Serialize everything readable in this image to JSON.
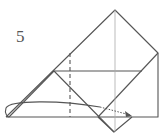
{
  "diagram": {
    "type": "origami-folding-step",
    "step_number": "5",
    "colors": {
      "line": "#555555",
      "thin_line": "#aaaaaa",
      "background": "#ffffff"
    },
    "elements": [
      "paper outline (triangle/pentagon shape)",
      "horizontal fold line",
      "dashed vertical valley fold line",
      "thin vertical center crease",
      "diamond flap at bottom",
      "curved arrow with dotted tip indicating fold to right"
    ]
  }
}
